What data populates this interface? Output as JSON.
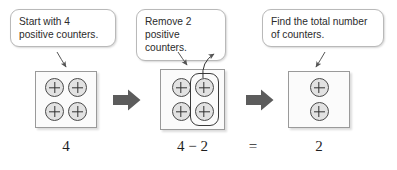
{
  "diagram": {
    "colors": {
      "counter_fill": "#e2e2e2",
      "counter_stroke": "#4a4a4a",
      "box_fill": "#fbfbfb",
      "box_stroke": "#9a9a9a",
      "callout_stroke": "#b9b9b9",
      "block_arrow": "#5c5c5c",
      "leader_arrow": "#555555",
      "text": "#2b2b2b"
    }
  },
  "callouts": [
    {
      "id": "callout-1",
      "text": "Start with 4\npositive counters."
    },
    {
      "id": "callout-2",
      "text": "Remove 2\npositive counters."
    },
    {
      "id": "callout-3",
      "text": "Find the total number\nof counters."
    }
  ],
  "steps": [
    {
      "id": "step-1",
      "label": "start",
      "counter_columns": [
        {
          "sign": "+",
          "count": 2
        },
        {
          "sign": "+",
          "count": 2
        }
      ],
      "total_counters": 4,
      "highlighted_column": null,
      "equation_text": "4"
    },
    {
      "id": "step-2",
      "label": "remove",
      "counter_columns": [
        {
          "sign": "+",
          "count": 2
        },
        {
          "sign": "+",
          "count": 2
        }
      ],
      "total_counters": 4,
      "highlighted_column": 1,
      "removed_count": 2,
      "equation_text": "4 − 2"
    },
    {
      "id": "step-3",
      "label": "result",
      "counter_columns": [
        {
          "sign": "+",
          "count": 2
        }
      ],
      "total_counters": 2,
      "highlighted_column": null,
      "equation_text": "2"
    }
  ],
  "equation": {
    "left": "4",
    "middle": "4 − 2",
    "equals": "=",
    "right": "2"
  },
  "arrows": {
    "transition_1": "right-block-arrow",
    "transition_2": "right-block-arrow",
    "leader_1": "points from callout 1 down to box 1",
    "leader_2": "points from callout 2 down to box 2",
    "leader_3": "points from removal ring up and out of box 2",
    "leader_4": "points from callout 3 down to box 3"
  }
}
